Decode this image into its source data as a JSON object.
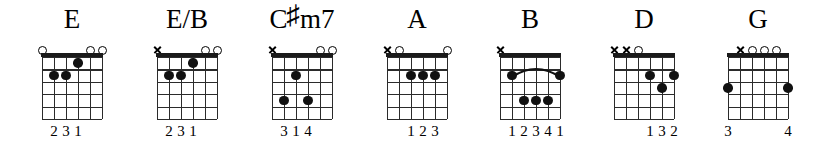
{
  "sheet": {
    "title": "Guitar chord diagram row",
    "string_count": 6,
    "fret_count": 5,
    "ink_color": "#111111",
    "background_color": "#ffffff"
  },
  "chords": [
    {
      "name": "E",
      "name_prefix": "E",
      "accidental": "",
      "name_suffix": "",
      "x": 20,
      "markers": [
        {
          "string": 6,
          "type": "open"
        },
        {
          "string": 5,
          "type": "none"
        },
        {
          "string": 4,
          "type": "none"
        },
        {
          "string": 3,
          "type": "none"
        },
        {
          "string": 2,
          "type": "open"
        },
        {
          "string": 1,
          "type": "open"
        }
      ],
      "dots": [
        {
          "string": 3,
          "fret": 1
        },
        {
          "string": 5,
          "fret": 2
        },
        {
          "string": 4,
          "fret": 2
        }
      ],
      "barre": null,
      "fingers": [
        {
          "string": 5,
          "label": "2"
        },
        {
          "string": 4,
          "label": "3"
        },
        {
          "string": 3,
          "label": "1"
        }
      ]
    },
    {
      "name": "E/B",
      "name_prefix": "E/B",
      "accidental": "",
      "name_suffix": "",
      "x": 135,
      "markers": [
        {
          "string": 6,
          "type": "mute"
        },
        {
          "string": 5,
          "type": "none"
        },
        {
          "string": 4,
          "type": "none"
        },
        {
          "string": 3,
          "type": "none"
        },
        {
          "string": 2,
          "type": "open"
        },
        {
          "string": 1,
          "type": "open"
        }
      ],
      "dots": [
        {
          "string": 3,
          "fret": 1
        },
        {
          "string": 5,
          "fret": 2
        },
        {
          "string": 4,
          "fret": 2
        }
      ],
      "barre": null,
      "fingers": [
        {
          "string": 5,
          "label": "2"
        },
        {
          "string": 4,
          "label": "3"
        },
        {
          "string": 3,
          "label": "1"
        }
      ]
    },
    {
      "name": "C#m7",
      "name_prefix": "C",
      "accidental": "♯",
      "name_suffix": "m7",
      "x": 250,
      "markers": [
        {
          "string": 6,
          "type": "mute"
        },
        {
          "string": 5,
          "type": "none"
        },
        {
          "string": 4,
          "type": "none"
        },
        {
          "string": 3,
          "type": "none"
        },
        {
          "string": 2,
          "type": "open"
        },
        {
          "string": 1,
          "type": "open"
        }
      ],
      "dots": [
        {
          "string": 4,
          "fret": 2
        },
        {
          "string": 5,
          "fret": 4
        },
        {
          "string": 3,
          "fret": 4
        }
      ],
      "barre": null,
      "fingers": [
        {
          "string": 5,
          "label": "3"
        },
        {
          "string": 4,
          "label": "1"
        },
        {
          "string": 3,
          "label": "4"
        }
      ]
    },
    {
      "name": "A",
      "name_prefix": "A",
      "accidental": "",
      "name_suffix": "",
      "x": 365,
      "markers": [
        {
          "string": 6,
          "type": "mute"
        },
        {
          "string": 5,
          "type": "open"
        },
        {
          "string": 4,
          "type": "none"
        },
        {
          "string": 3,
          "type": "none"
        },
        {
          "string": 2,
          "type": "none"
        },
        {
          "string": 1,
          "type": "open"
        }
      ],
      "dots": [
        {
          "string": 4,
          "fret": 2
        },
        {
          "string": 3,
          "fret": 2
        },
        {
          "string": 2,
          "fret": 2
        }
      ],
      "barre": null,
      "fingers": [
        {
          "string": 4,
          "label": "1"
        },
        {
          "string": 3,
          "label": "2"
        },
        {
          "string": 2,
          "label": "3"
        }
      ]
    },
    {
      "name": "B",
      "name_prefix": "B",
      "accidental": "",
      "name_suffix": "",
      "x": 478,
      "markers": [
        {
          "string": 6,
          "type": "mute"
        },
        {
          "string": 5,
          "type": "none"
        },
        {
          "string": 4,
          "type": "none"
        },
        {
          "string": 3,
          "type": "none"
        },
        {
          "string": 2,
          "type": "none"
        },
        {
          "string": 1,
          "type": "none"
        }
      ],
      "dots": [
        {
          "string": 5,
          "fret": 2
        },
        {
          "string": 1,
          "fret": 2
        },
        {
          "string": 4,
          "fret": 4
        },
        {
          "string": 3,
          "fret": 4
        },
        {
          "string": 2,
          "fret": 4
        }
      ],
      "barre": {
        "from_string": 5,
        "to_string": 1,
        "fret": 2
      },
      "fingers": [
        {
          "string": 5,
          "label": "1"
        },
        {
          "string": 4,
          "label": "2"
        },
        {
          "string": 3,
          "label": "3"
        },
        {
          "string": 2,
          "label": "4"
        },
        {
          "string": 1,
          "label": "1"
        }
      ]
    },
    {
      "name": "D",
      "name_prefix": "D",
      "accidental": "",
      "name_suffix": "",
      "x": 592,
      "markers": [
        {
          "string": 6,
          "type": "mute"
        },
        {
          "string": 5,
          "type": "mute"
        },
        {
          "string": 4,
          "type": "open"
        },
        {
          "string": 3,
          "type": "none"
        },
        {
          "string": 2,
          "type": "none"
        },
        {
          "string": 1,
          "type": "none"
        }
      ],
      "dots": [
        {
          "string": 3,
          "fret": 2
        },
        {
          "string": 1,
          "fret": 2
        },
        {
          "string": 2,
          "fret": 3
        }
      ],
      "barre": null,
      "fingers": [
        {
          "string": 3,
          "label": "1"
        },
        {
          "string": 2,
          "label": "3"
        },
        {
          "string": 1,
          "label": "2"
        }
      ]
    },
    {
      "name": "G",
      "name_prefix": "G",
      "accidental": "",
      "name_suffix": "",
      "x": 706,
      "markers": [
        {
          "string": 6,
          "type": "none"
        },
        {
          "string": 5,
          "type": "mute"
        },
        {
          "string": 4,
          "type": "open"
        },
        {
          "string": 3,
          "type": "open"
        },
        {
          "string": 2,
          "type": "open"
        },
        {
          "string": 1,
          "type": "none"
        }
      ],
      "dots": [
        {
          "string": 6,
          "fret": 3
        },
        {
          "string": 1,
          "fret": 3
        }
      ],
      "barre": null,
      "fingers": [
        {
          "string": 6,
          "label": "3"
        },
        {
          "string": 1,
          "label": "4"
        }
      ]
    }
  ]
}
